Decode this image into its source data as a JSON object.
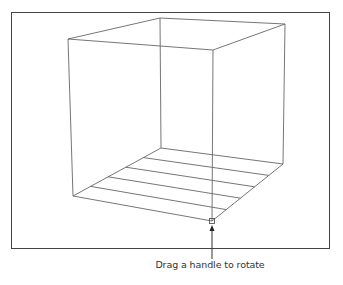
{
  "caption": "Drag a handle to rotate",
  "colors": {
    "line": "#666666",
    "border": "#444444",
    "background": "#ffffff"
  },
  "cube": {
    "top": {
      "left": [
        68,
        39
      ],
      "back": [
        160,
        18
      ],
      "right": [
        285,
        24
      ],
      "front": [
        213,
        50
      ]
    },
    "bottom": {
      "left": [
        73,
        196
      ],
      "back": [
        161,
        148
      ],
      "right": [
        283,
        164
      ],
      "front": [
        212,
        221
      ]
    },
    "floor_grid_divisions": 5
  },
  "handle": {
    "position": [
      212,
      221
    ],
    "label": "rotate-handle"
  }
}
